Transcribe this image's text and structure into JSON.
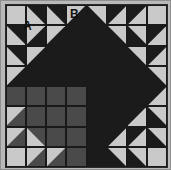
{
  "figure": {
    "name": "pieced-quilt-block",
    "width": 171,
    "height": 170
  },
  "labels": [
    {
      "id": "A",
      "text": "A",
      "description": "label on large light-gray corner triangle patch"
    },
    {
      "id": "B",
      "text": "B",
      "description": "label on small light-gray triangle patch in top row"
    }
  ],
  "colors": {
    "light": "#c9c9c9",
    "dark": "#1b1b1b",
    "medium": "#4a4a4a",
    "mat": "#b9b9b9",
    "seam": "#1a1a1a",
    "frame_border": "#8f8f8f",
    "label_text": "#111111",
    "page_background": "#ffffff"
  },
  "grid": {
    "columns": 8,
    "rows": 8,
    "unit": "half-square-triangle",
    "quadrants": [
      {
        "name": "top-left",
        "accent": "dark",
        "background": "light"
      },
      {
        "name": "top-right",
        "accent": "dark",
        "background": "light"
      },
      {
        "name": "bottom-left",
        "accent": "medium",
        "background": "light"
      },
      {
        "name": "bottom-right",
        "accent": "dark",
        "background": "light"
      }
    ]
  },
  "cells": [
    {
      "r": 0,
      "c": 0,
      "fill": "light",
      "accent": "dark",
      "orient": "none"
    },
    {
      "r": 0,
      "c": 1,
      "fill": "light",
      "accent": "dark",
      "orient": "tr"
    },
    {
      "r": 0,
      "c": 2,
      "fill": "light",
      "accent": "dark",
      "orient": "tr"
    },
    {
      "r": 0,
      "c": 3,
      "fill": "light",
      "accent": "dark",
      "orient": "br"
    },
    {
      "r": 0,
      "c": 4,
      "fill": "light",
      "accent": "dark",
      "orient": "bl"
    },
    {
      "r": 0,
      "c": 5,
      "fill": "light",
      "accent": "dark",
      "orient": "tl"
    },
    {
      "r": 0,
      "c": 6,
      "fill": "light",
      "accent": "dark",
      "orient": "tl"
    },
    {
      "r": 0,
      "c": 7,
      "fill": "light",
      "accent": "dark",
      "orient": "none"
    },
    {
      "r": 1,
      "c": 0,
      "fill": "light",
      "accent": "dark",
      "orient": "tr"
    },
    {
      "r": 1,
      "c": 1,
      "fill": "light",
      "accent": "dark",
      "orient": "br"
    },
    {
      "r": 1,
      "c": 2,
      "fill": "light",
      "accent": "dark",
      "orient": "br"
    },
    {
      "r": 1,
      "c": 3,
      "fill": "dark",
      "accent": "dark",
      "orient": "full"
    },
    {
      "r": 1,
      "c": 4,
      "fill": "dark",
      "accent": "dark",
      "orient": "full"
    },
    {
      "r": 1,
      "c": 5,
      "fill": "light",
      "accent": "dark",
      "orient": "bl"
    },
    {
      "r": 1,
      "c": 6,
      "fill": "light",
      "accent": "dark",
      "orient": "bl"
    },
    {
      "r": 1,
      "c": 7,
      "fill": "light",
      "accent": "dark",
      "orient": "tl"
    },
    {
      "r": 2,
      "c": 0,
      "fill": "light",
      "accent": "dark",
      "orient": "tr"
    },
    {
      "r": 2,
      "c": 1,
      "fill": "light",
      "accent": "dark",
      "orient": "br"
    },
    {
      "r": 2,
      "c": 2,
      "fill": "dark",
      "accent": "dark",
      "orient": "full"
    },
    {
      "r": 2,
      "c": 3,
      "fill": "dark",
      "accent": "dark",
      "orient": "full"
    },
    {
      "r": 2,
      "c": 4,
      "fill": "dark",
      "accent": "dark",
      "orient": "full"
    },
    {
      "r": 2,
      "c": 5,
      "fill": "dark",
      "accent": "dark",
      "orient": "full"
    },
    {
      "r": 2,
      "c": 6,
      "fill": "light",
      "accent": "dark",
      "orient": "bl"
    },
    {
      "r": 2,
      "c": 7,
      "fill": "light",
      "accent": "dark",
      "orient": "tl"
    },
    {
      "r": 3,
      "c": 0,
      "fill": "light",
      "accent": "dark",
      "orient": "br"
    },
    {
      "r": 3,
      "c": 1,
      "fill": "dark",
      "accent": "dark",
      "orient": "full"
    },
    {
      "r": 3,
      "c": 2,
      "fill": "dark",
      "accent": "dark",
      "orient": "full"
    },
    {
      "r": 3,
      "c": 3,
      "fill": "dark",
      "accent": "dark",
      "orient": "full"
    },
    {
      "r": 3,
      "c": 4,
      "fill": "dark",
      "accent": "dark",
      "orient": "full"
    },
    {
      "r": 3,
      "c": 5,
      "fill": "dark",
      "accent": "dark",
      "orient": "full"
    },
    {
      "r": 3,
      "c": 6,
      "fill": "dark",
      "accent": "dark",
      "orient": "full"
    },
    {
      "r": 3,
      "c": 7,
      "fill": "light",
      "accent": "dark",
      "orient": "bl"
    },
    {
      "r": 4,
      "c": 0,
      "fill": "medium",
      "accent": "medium",
      "orient": "tr"
    },
    {
      "r": 4,
      "c": 1,
      "fill": "medium",
      "accent": "medium",
      "orient": "full"
    },
    {
      "r": 4,
      "c": 2,
      "fill": "medium",
      "accent": "medium",
      "orient": "full"
    },
    {
      "r": 4,
      "c": 3,
      "fill": "medium",
      "accent": "medium",
      "orient": "full"
    },
    {
      "r": 4,
      "c": 4,
      "fill": "dark",
      "accent": "dark",
      "orient": "full"
    },
    {
      "r": 4,
      "c": 5,
      "fill": "dark",
      "accent": "dark",
      "orient": "full"
    },
    {
      "r": 4,
      "c": 6,
      "fill": "dark",
      "accent": "dark",
      "orient": "full"
    },
    {
      "r": 4,
      "c": 7,
      "fill": "light",
      "accent": "dark",
      "orient": "tl"
    },
    {
      "r": 5,
      "c": 0,
      "fill": "light",
      "accent": "medium",
      "orient": "br"
    },
    {
      "r": 5,
      "c": 1,
      "fill": "medium",
      "accent": "medium",
      "orient": "tr"
    },
    {
      "r": 5,
      "c": 2,
      "fill": "medium",
      "accent": "medium",
      "orient": "full"
    },
    {
      "r": 5,
      "c": 3,
      "fill": "medium",
      "accent": "medium",
      "orient": "full"
    },
    {
      "r": 5,
      "c": 4,
      "fill": "dark",
      "accent": "dark",
      "orient": "full"
    },
    {
      "r": 5,
      "c": 5,
      "fill": "dark",
      "accent": "dark",
      "orient": "full"
    },
    {
      "r": 5,
      "c": 6,
      "fill": "light",
      "accent": "dark",
      "orient": "tl"
    },
    {
      "r": 5,
      "c": 7,
      "fill": "light",
      "accent": "dark",
      "orient": "bl"
    },
    {
      "r": 6,
      "c": 0,
      "fill": "light",
      "accent": "medium",
      "orient": "br"
    },
    {
      "r": 6,
      "c": 1,
      "fill": "light",
      "accent": "medium",
      "orient": "tr"
    },
    {
      "r": 6,
      "c": 2,
      "fill": "medium",
      "accent": "medium",
      "orient": "tr"
    },
    {
      "r": 6,
      "c": 3,
      "fill": "medium",
      "accent": "medium",
      "orient": "full"
    },
    {
      "r": 6,
      "c": 4,
      "fill": "dark",
      "accent": "dark",
      "orient": "full"
    },
    {
      "r": 6,
      "c": 5,
      "fill": "light",
      "accent": "dark",
      "orient": "tl"
    },
    {
      "r": 6,
      "c": 6,
      "fill": "light",
      "accent": "dark",
      "orient": "tl"
    },
    {
      "r": 6,
      "c": 7,
      "fill": "light",
      "accent": "dark",
      "orient": "bl"
    },
    {
      "r": 7,
      "c": 0,
      "fill": "light",
      "accent": "medium",
      "orient": "none"
    },
    {
      "r": 7,
      "c": 1,
      "fill": "light",
      "accent": "medium",
      "orient": "br"
    },
    {
      "r": 7,
      "c": 2,
      "fill": "light",
      "accent": "medium",
      "orient": "br"
    },
    {
      "r": 7,
      "c": 3,
      "fill": "medium",
      "accent": "medium",
      "orient": "tr"
    },
    {
      "r": 7,
      "c": 4,
      "fill": "dark",
      "accent": "dark",
      "orient": "tl"
    },
    {
      "r": 7,
      "c": 5,
      "fill": "light",
      "accent": "dark",
      "orient": "bl"
    },
    {
      "r": 7,
      "c": 6,
      "fill": "light",
      "accent": "dark",
      "orient": "bl"
    },
    {
      "r": 7,
      "c": 7,
      "fill": "light",
      "accent": "dark",
      "orient": "none"
    }
  ]
}
